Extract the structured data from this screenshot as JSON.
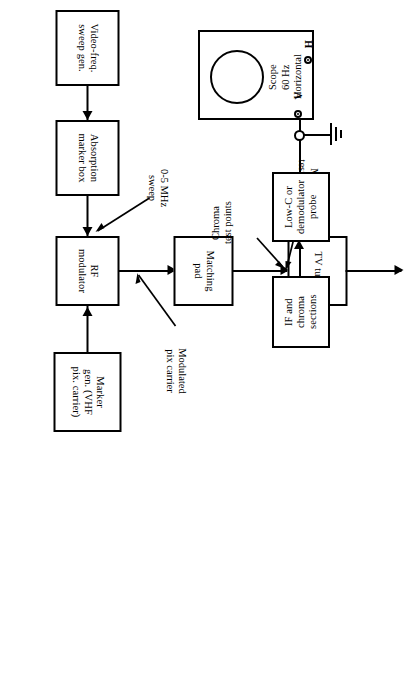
{
  "figure": {
    "type": "block-diagram",
    "orientation": "rotated-90-ccw",
    "line_color": "#000000",
    "background_color": "#ffffff"
  },
  "blocks": [
    {
      "id": "video-sweep-gen",
      "label": "Video-freq.\nsweep gen."
    },
    {
      "id": "absorption-marker",
      "label": "Absorption\nmarker box"
    },
    {
      "id": "rf-modulator",
      "label": "RF\nmodulator"
    },
    {
      "id": "marker-gen",
      "label": "Marker\ngen. (VHF\npix. carrier)"
    },
    {
      "id": "matching-pad",
      "label": "Matching\npad"
    },
    {
      "id": "tv-tuner",
      "label": "TV tuner"
    },
    {
      "id": "if-chroma",
      "label": "IF and\nchroma\nsections"
    },
    {
      "id": "demod-probe",
      "label": "Low-C or\ndemodulator\nprobe"
    }
  ],
  "annotations": [
    {
      "id": "sweep-range",
      "label": "0-5 MHz\nsweep"
    },
    {
      "id": "modulated-carrier",
      "label": "Modulated\npix carrier"
    },
    {
      "id": "mixer-test",
      "label": "Mixer\ntest points"
    },
    {
      "id": "chroma-test",
      "label": "Chroma\ntest points"
    }
  ],
  "scope": {
    "label": "Scope\n60 Hz\nHorizontal",
    "vertical_terminal": "V",
    "horizontal_terminal": "H",
    "ground_symbol": "earth-ground"
  }
}
